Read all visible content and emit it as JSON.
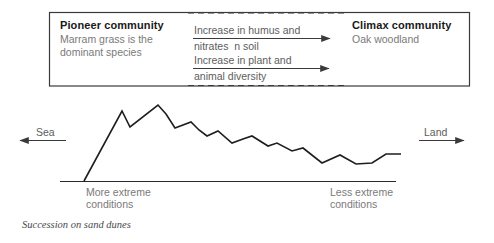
{
  "diagram": {
    "caption": "Succession on sand dunes",
    "panel": {
      "pioneer": {
        "title": "Pioneer community",
        "line1": "Marram grass is the",
        "line2": "dominant species"
      },
      "climax": {
        "title": "Climax community",
        "line1": "Oak woodland"
      },
      "arrows": [
        {
          "name": "humus-nitrates-arrow",
          "line1": "Increase in humus and",
          "line2": "nitrates  n soil"
        },
        {
          "name": "plant-animal-diversity-arrow",
          "line1": "Increase in plant and",
          "line2": "animal diversity"
        }
      ]
    },
    "profile": {
      "sea_label": "Sea",
      "land_label": "Land",
      "left_condition_line1": "More extreme",
      "left_condition_line2": "conditions",
      "right_condition_line1": "Less extreme",
      "right_condition_line2": "conditions"
    },
    "colors": {
      "ink": "#222222",
      "text": "#6e6e6e",
      "heading": "#1a1a1a",
      "rule": "#3a3a3a",
      "background": "#ffffff"
    }
  },
  "chart_data": {
    "type": "line",
    "title": "Succession on sand dunes",
    "xlabel": "Distance from sea (sea → land)",
    "ylabel": "Dune height / relief",
    "grid": false,
    "legend": null,
    "annotations": [
      "Sea",
      "Land",
      "More extreme conditions",
      "Less extreme conditions"
    ],
    "baseline_y": 181,
    "series": [
      {
        "name": "Dune profile",
        "points": [
          [
            84,
            181
          ],
          [
            122,
            111
          ],
          [
            130,
            127
          ],
          [
            158,
            105
          ],
          [
            166,
            114
          ],
          [
            175,
            128
          ],
          [
            191,
            122
          ],
          [
            199,
            130
          ],
          [
            207,
            136
          ],
          [
            218,
            131
          ],
          [
            232,
            143
          ],
          [
            243,
            139
          ],
          [
            252,
            136
          ],
          [
            268,
            146
          ],
          [
            277,
            143
          ],
          [
            292,
            151
          ],
          [
            303,
            148
          ],
          [
            322,
            163
          ],
          [
            340,
            155
          ],
          [
            356,
            164
          ],
          [
            372,
            163
          ],
          [
            386,
            154
          ],
          [
            401,
            154
          ]
        ]
      }
    ]
  }
}
